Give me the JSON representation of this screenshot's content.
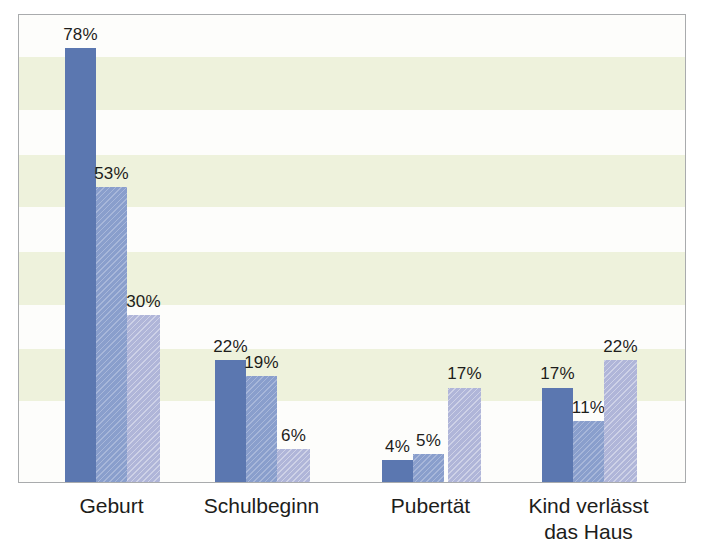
{
  "chart_data": {
    "type": "bar",
    "title": "",
    "subtitle": "",
    "xlabel": "",
    "ylabel": "",
    "ylim": [
      0,
      84
    ],
    "grid": "horizontal-alternating-bands",
    "legend_position": "none",
    "categories": [
      "Geburt",
      "Schulbeginn",
      "Pubertät",
      "Kind verlässt\ndas Haus"
    ],
    "value_suffix": "%",
    "series": [
      {
        "name": "series-1",
        "color": "#5b77b0",
        "pattern": "solid",
        "values": [
          78,
          22,
          4,
          17
        ],
        "labels": [
          "78%",
          "22%",
          "4%",
          "17%"
        ]
      },
      {
        "name": "series-2",
        "color": "#8fa3cf",
        "pattern": "diagonal-hatch",
        "values": [
          53,
          19,
          5,
          11
        ],
        "labels": [
          "53%",
          "19%",
          "5%",
          "11%"
        ]
      },
      {
        "name": "series-3",
        "color": "#b9bedd",
        "pattern": "diagonal-hatch",
        "values": [
          30,
          6,
          17,
          22
        ],
        "labels": [
          "30%",
          "6%",
          "17%",
          "22%"
        ]
      }
    ],
    "bands": {
      "color": "#eef2dc",
      "ranges_percent": [
        [
          67.0,
          76.5
        ],
        [
          49.5,
          58.9
        ],
        [
          31.9,
          41.3
        ],
        [
          14.5,
          23.9
        ]
      ]
    },
    "frame": {
      "border_color": "#a9abad",
      "background": "#fdfdfb"
    },
    "label_color": "#1d1d1b"
  }
}
